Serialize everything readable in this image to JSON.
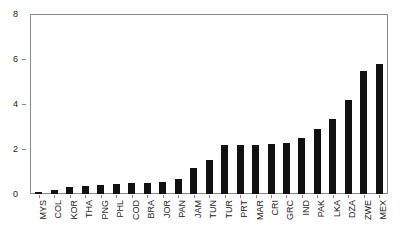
{
  "chart_data": {
    "type": "bar",
    "title": "",
    "subtitle": "",
    "xlabel": "",
    "ylabel": "",
    "grid": false,
    "legend": "none",
    "ylim": [
      0,
      8
    ],
    "yticks": [
      0,
      2,
      4,
      6,
      8
    ],
    "ytick_labels": [
      "0",
      "2",
      "4",
      "6",
      "8"
    ],
    "categories": [
      "MYS",
      "COL",
      "KOR",
      "THA",
      "PNG",
      "PHL",
      "COD",
      "BRA",
      "JOR",
      "PAN",
      "JAM",
      "TUN",
      "TUR",
      "PRT",
      "MAR",
      "CRI",
      "GRC",
      "IND",
      "PAK",
      "LKA",
      "DZA",
      "ZWE",
      "MEX"
    ],
    "values": [
      0.1,
      0.2,
      0.3,
      0.35,
      0.4,
      0.45,
      0.5,
      0.5,
      0.55,
      0.65,
      1.15,
      1.5,
      2.2,
      2.2,
      2.2,
      2.25,
      2.3,
      2.5,
      2.9,
      3.35,
      4.2,
      5.5,
      5.8
    ],
    "bar_color": "#111111",
    "axis_color": "#8a8a8a"
  }
}
